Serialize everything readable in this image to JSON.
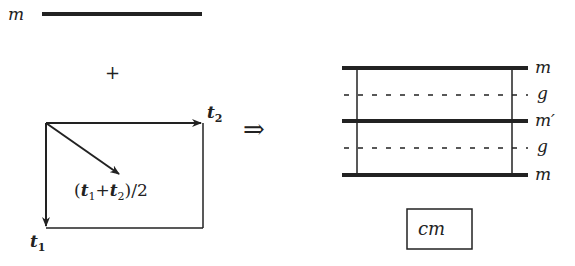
{
  "colors": {
    "ink": "#222222",
    "background": "#ffffff"
  },
  "left": {
    "top_line_label": "m",
    "plus": "+",
    "vector_t1": "t",
    "vector_t1_sub": "1",
    "vector_t2": "t",
    "vector_t2_sub": "2",
    "diagonal_label": {
      "open": "(",
      "t1": "t",
      "t1_sub": "1",
      "plus": "+",
      "t2": "t",
      "t2_sub": "2",
      "close": ")/2"
    }
  },
  "implies": "⇒",
  "right": {
    "labels": [
      "m",
      "g",
      "m′",
      "g",
      "m"
    ],
    "box_label": "cm"
  }
}
